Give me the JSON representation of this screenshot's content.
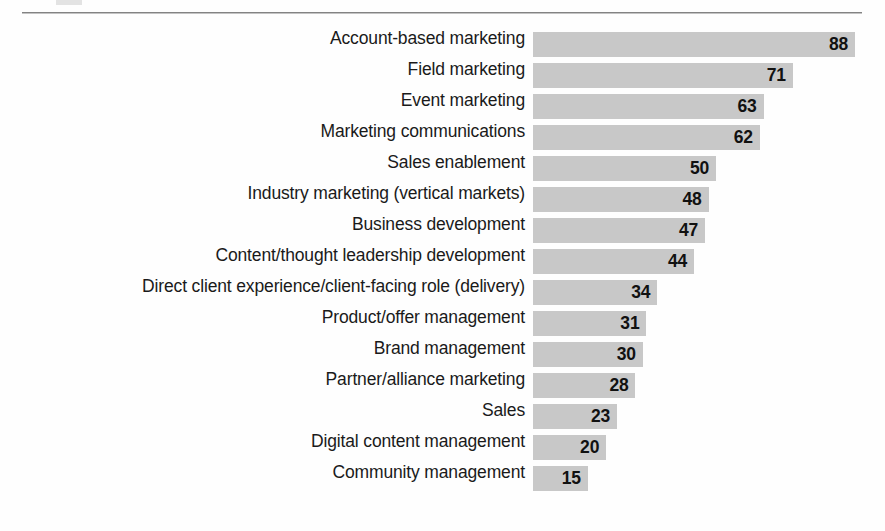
{
  "figure": {
    "kind": "horizontal-bar-chart",
    "background_color": "#fefefe",
    "rule_color": "#6e6e6e",
    "bar_color": "#c8c8c8",
    "label_color": "#1a1a1a",
    "value_color": "#111111"
  },
  "chart_data": {
    "type": "bar",
    "orientation": "horizontal",
    "title": "",
    "subtitle": "",
    "xlabel": "",
    "ylabel": "",
    "grid": false,
    "legend": false,
    "value_labels_inside_bars": true,
    "sorted": "descending",
    "xlim": [
      0,
      88
    ],
    "categories": [
      "Account-based marketing",
      "Field marketing",
      "Event marketing",
      "Marketing communications",
      "Sales enablement",
      "Industry marketing (vertical markets)",
      "Business development",
      "Content/thought leadership development",
      "Direct client experience/client-facing role (delivery)",
      "Product/offer management",
      "Brand management",
      "Partner/alliance marketing",
      "Sales",
      "Digital content management",
      "Community management"
    ],
    "values": [
      88,
      71,
      63,
      62,
      50,
      48,
      47,
      44,
      34,
      31,
      30,
      28,
      23,
      20,
      15
    ]
  }
}
